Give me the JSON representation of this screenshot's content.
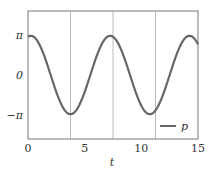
{
  "chart_data": {
    "type": "line",
    "title": "",
    "xlabel": "t",
    "ylabel": "",
    "xlim": [
      0,
      15
    ],
    "ylim": [
      -4.6,
      5.6
    ],
    "xticks": [
      0,
      5,
      10,
      15
    ],
    "xtick_labels": [
      "0",
      "5",
      "10",
      "15"
    ],
    "yticks": [
      3.1416,
      0,
      -3.1416
    ],
    "ytick_labels": [
      "π",
      "0",
      "−π"
    ],
    "grid": false,
    "vertical_lines": [
      3.75,
      7.5,
      11.25
    ],
    "legend": {
      "position": "lower right",
      "entries": [
        "p"
      ]
    },
    "series": [
      {
        "name": "p",
        "color": "#666666",
        "x": [
          0,
          0.5,
          1,
          1.5,
          2,
          2.5,
          3,
          3.5,
          3.75,
          4,
          4.5,
          5,
          5.5,
          6,
          6.5,
          7,
          7.25,
          7.5,
          8,
          8.5,
          9,
          9.5,
          10,
          10.5,
          10.75,
          11,
          11.5,
          12,
          12.5,
          13,
          13.5,
          14,
          14.25,
          14.5,
          15
        ],
        "y": [
          2.9,
          2.7,
          2.0,
          0.6,
          -1.0,
          -2.3,
          -2.95,
          -3.1,
          -3.12,
          -3.05,
          -2.5,
          -1.2,
          0.5,
          2.0,
          2.8,
          3.05,
          3.08,
          3.0,
          2.4,
          1.0,
          -0.8,
          -2.2,
          -2.95,
          -3.1,
          -3.12,
          -3.05,
          -2.5,
          -1.2,
          0.5,
          2.0,
          2.8,
          3.05,
          3.08,
          3.0,
          2.6
        ]
      }
    ]
  }
}
